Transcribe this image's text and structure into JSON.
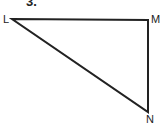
{
  "problem": {
    "number": "3."
  },
  "triangle": {
    "vertices": [
      {
        "name": "L",
        "x": 12,
        "y": 19
      },
      {
        "name": "M",
        "x": 148,
        "y": 20
      },
      {
        "name": "N",
        "x": 148,
        "y": 112
      }
    ],
    "labels": {
      "L": "L",
      "M": "M",
      "N": "N"
    },
    "stroke_color": "#222222"
  }
}
